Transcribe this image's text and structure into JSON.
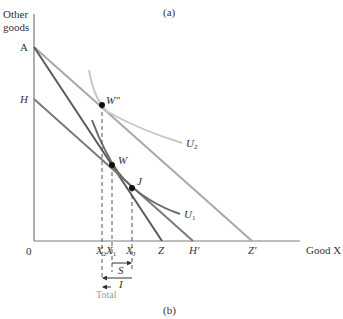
{
  "captions": {
    "top": "(a)",
    "bottom": "(b)"
  },
  "axes": {
    "y_label_line1": "Other",
    "y_label_line2": "goods",
    "x_label": "Good X",
    "origin": "0"
  },
  "points": {
    "A": "A",
    "H": "H",
    "Z": "Z",
    "H_prime": "H′",
    "Z_prime": "Z′",
    "W_prime": "W″",
    "W": "W",
    "J": "J"
  },
  "curves": {
    "U1": "U",
    "U1_sub": "1",
    "U2": "U",
    "U2_sub": "2"
  },
  "x_ticks": {
    "X2": "X",
    "X2_sub": "2",
    "X1": "X",
    "X1_sub": "1",
    "XJ": "X",
    "XJ_sub": "J"
  },
  "effects": {
    "substitution": "S",
    "income": "I",
    "total": "Total"
  },
  "colors": {
    "axis": "#7a7a7a",
    "dark_line": "#5a5a5a",
    "light_line": "#a8a8a8",
    "u2_curve": "#c8c8c8",
    "u1_curve": "#6a6a6a",
    "dot": "#111111",
    "dashed": "#555555"
  }
}
